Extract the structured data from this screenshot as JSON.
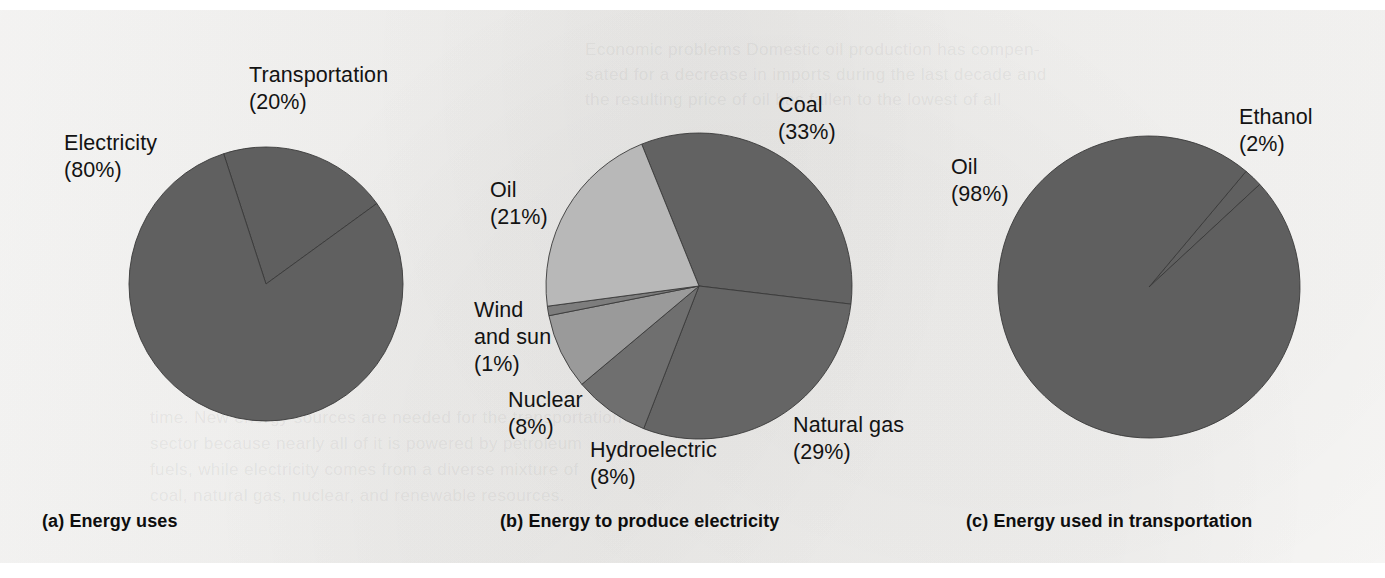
{
  "figure": {
    "background_color": "#f1f0ee",
    "outer_color": "#ffffff",
    "text_color": "#131313"
  },
  "bleed_text": [
    {
      "text": "Economic  problems  Domestic  oil  production  has  compen-",
      "x": 585,
      "y": 30
    },
    {
      "text": "sated  for  a  decrease  in  imports  during  the  last  decade  and",
      "x": 585,
      "y": 55
    },
    {
      "text": "the  resulting  price  of  oil  has  fallen  to  the  lowest  of  all",
      "x": 585,
      "y": 80
    },
    {
      "text": "time.  New  energy  sources  are  needed  for  the  transportation",
      "x": 150,
      "y": 398
    },
    {
      "text": "sector  because  nearly  all  of  it  is  powered  by  petroleum",
      "x": 150,
      "y": 424
    },
    {
      "text": "fuels,  while  electricity  comes  from  a  diverse  mixture  of",
      "x": 150,
      "y": 450
    },
    {
      "text": "coal,  natural  gas,  nuclear,  and  renewable  resources.",
      "x": 150,
      "y": 476
    }
  ],
  "charts": [
    {
      "id": "energy-uses",
      "caption": "(a) Energy uses",
      "caption_x": 42,
      "caption_y": 511,
      "center_x": 266,
      "center_y": 284,
      "radius": 137,
      "start_angle_deg": -18,
      "slices": [
        {
          "label": "Transportation",
          "value_label": "(20%)",
          "value": 20,
          "color": "#5f5f5f"
        },
        {
          "label": "Electricity",
          "value_label": "(80%)",
          "value": 80,
          "color": "#606060"
        }
      ],
      "labels": [
        {
          "lines": [
            "Transportation",
            "(20%)"
          ],
          "x": 249,
          "y": 62
        },
        {
          "lines": [
            "Electricity",
            "(80%)"
          ],
          "x": 64,
          "y": 130
        }
      ]
    },
    {
      "id": "energy-to-produce-electricity",
      "caption": "(b) Energy to produce electricity",
      "caption_x": 500,
      "caption_y": 511,
      "center_x": 699,
      "center_y": 286,
      "radius": 153,
      "start_angle_deg": -22,
      "slices": [
        {
          "label": "Coal",
          "value_label": "(33%)",
          "value": 33,
          "color": "#626262"
        },
        {
          "label": "Natural gas",
          "value_label": "(29%)",
          "value": 29,
          "color": "#656565"
        },
        {
          "label": "Hydroelectric",
          "value_label": "(8%)",
          "value": 8,
          "color": "#6f6f6f"
        },
        {
          "label": "Nuclear",
          "value_label": "(8%)",
          "value": 8,
          "color": "#9a9a9a"
        },
        {
          "label": "Wind and sun",
          "value_label": "(1%)",
          "value": 1,
          "color": "#7d7d7d"
        },
        {
          "label": "Oil",
          "value_label": "(21%)",
          "value": 21,
          "color": "#b8b8b8"
        }
      ],
      "labels": [
        {
          "lines": [
            "Coal",
            "(33%)"
          ],
          "x": 778,
          "y": 92
        },
        {
          "lines": [
            "Oil",
            "(21%)"
          ],
          "x": 490,
          "y": 177
        },
        {
          "lines": [
            "Wind",
            "and sun",
            "(1%)"
          ],
          "x": 474,
          "y": 297
        },
        {
          "lines": [
            "Nuclear",
            "(8%)"
          ],
          "x": 508,
          "y": 387
        },
        {
          "lines": [
            "Hydroelectric",
            "(8%)"
          ],
          "x": 590,
          "y": 437
        },
        {
          "lines": [
            "Natural gas",
            "(29%)"
          ],
          "x": 793,
          "y": 412
        }
      ]
    },
    {
      "id": "energy-used-in-transportation",
      "caption": "(c) Energy used in transportation",
      "caption_x": 966,
      "caption_y": 511,
      "center_x": 1149,
      "center_y": 287,
      "radius": 151,
      "start_angle_deg": 40,
      "slices": [
        {
          "label": "Ethanol",
          "value_label": "(2%)",
          "value": 2,
          "color": "#606060"
        },
        {
          "label": "Oil",
          "value_label": "(98%)",
          "value": 98,
          "color": "#5f5f5f"
        }
      ],
      "labels": [
        {
          "lines": [
            "Ethanol",
            "(2%)"
          ],
          "x": 1239,
          "y": 104
        },
        {
          "lines": [
            "Oil",
            "(98%)"
          ],
          "x": 951,
          "y": 154
        }
      ]
    }
  ]
}
